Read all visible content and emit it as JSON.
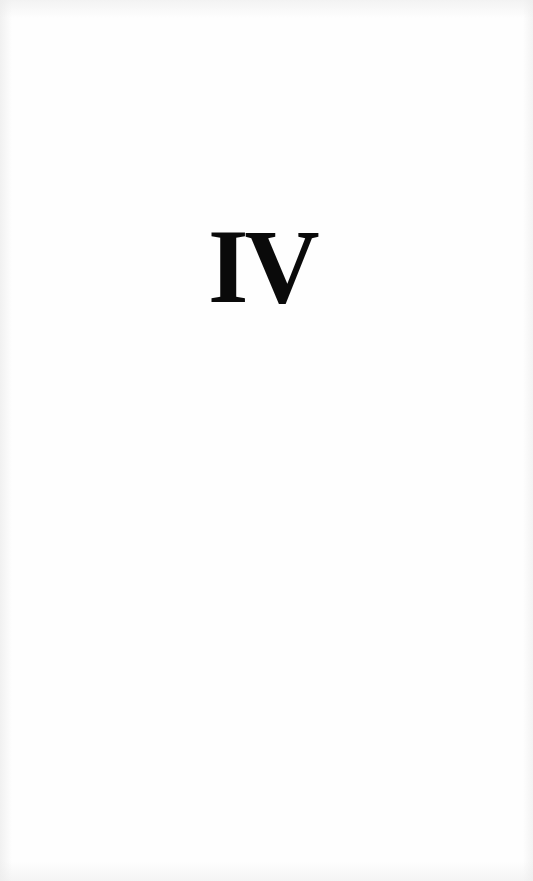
{
  "page": {
    "chapter_numeral": "IV"
  }
}
